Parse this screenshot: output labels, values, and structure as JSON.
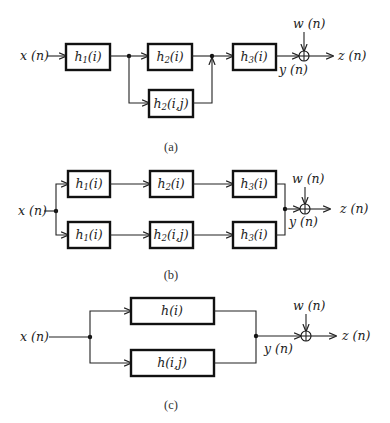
{
  "diagrams": {
    "a": {
      "caption": "(a)",
      "input": "x (n)",
      "noise": "w (n)",
      "mid_output": "y (n)",
      "output": "z (n)",
      "blocks": {
        "h1": {
          "base": "h",
          "sub": "1",
          "arg": "(i)"
        },
        "h2_linear": {
          "base": "h",
          "sub": "2",
          "arg": "(i)"
        },
        "h2_nonlinear": {
          "base": "h",
          "sub": "2",
          "arg": "(i,j)"
        },
        "h3": {
          "base": "h",
          "sub": "3",
          "arg": "(i)"
        }
      }
    },
    "b": {
      "caption": "(b)",
      "input": "x (n)",
      "noise": "w (n)",
      "mid_output": "y (n)",
      "output": "z (n)",
      "top_row": [
        {
          "base": "h",
          "sub": "1",
          "arg": "(i)"
        },
        {
          "base": "h",
          "sub": "2",
          "arg": "(i)"
        },
        {
          "base": "h",
          "sub": "3",
          "arg": "(i)"
        }
      ],
      "bottom_row": [
        {
          "base": "h",
          "sub": "1",
          "arg": "(i)"
        },
        {
          "base": "h",
          "sub": "2",
          "arg": "(i,j)"
        },
        {
          "base": "h",
          "sub": "3",
          "arg": "(i)"
        }
      ]
    },
    "c": {
      "caption": "(c)",
      "input": "x (n)",
      "noise": "w (n)",
      "mid_output": "y (n)",
      "output": "z (n)",
      "blocks": {
        "linear": "h(i)",
        "nonlinear": "h(i,j)"
      }
    }
  }
}
